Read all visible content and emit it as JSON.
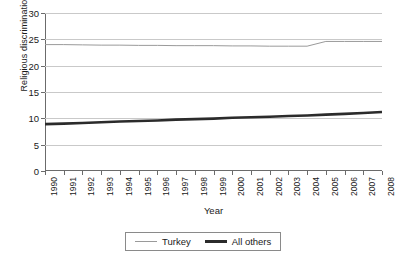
{
  "chart_data": {
    "type": "line",
    "title": "",
    "xlabel": "Year",
    "ylabel": "Religious discrimination",
    "categories": [
      "1990",
      "1991",
      "1992",
      "1993",
      "1994",
      "1995",
      "1996",
      "1997",
      "1998",
      "1999",
      "2000",
      "2001",
      "2002",
      "2003",
      "2004",
      "2005",
      "2006",
      "2007",
      "2008"
    ],
    "ylim": [
      0,
      30
    ],
    "yticks": [
      0,
      5,
      10,
      15,
      20,
      25,
      30
    ],
    "grid": "horizontal",
    "legend_position": "bottom",
    "series": [
      {
        "name": "Turkey",
        "color": "#9a9a9a",
        "line_width": 1,
        "values": [
          24.0,
          24.0,
          23.95,
          23.9,
          23.9,
          23.85,
          23.85,
          23.8,
          23.8,
          23.8,
          23.75,
          23.75,
          23.7,
          23.7,
          23.7,
          24.6,
          24.6,
          24.6,
          24.6
        ]
      },
      {
        "name": "All others",
        "color": "#2b2b2b",
        "line_width": 2.6,
        "values": [
          8.9,
          9.0,
          9.1,
          9.25,
          9.4,
          9.5,
          9.6,
          9.75,
          9.85,
          9.95,
          10.1,
          10.2,
          10.3,
          10.45,
          10.55,
          10.7,
          10.85,
          11.0,
          11.2
        ]
      }
    ]
  },
  "legend": {
    "items": [
      {
        "label": "Turkey"
      },
      {
        "label": "All others"
      }
    ]
  }
}
